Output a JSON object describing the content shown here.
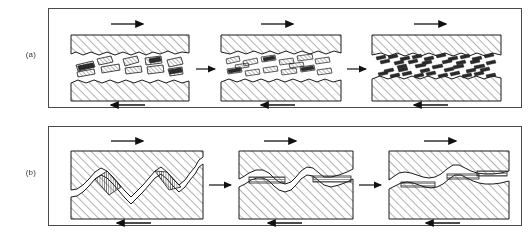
{
  "figure": {
    "panels": [
      {
        "id": "panel-a",
        "label": "(a)",
        "caption_text": "(a)",
        "mechanism": "wear-debris-fragmentation",
        "stages": [
          {
            "index": 1,
            "name": "stage-coarse-debris",
            "top_arrow": "right",
            "bottom_arrow": "left",
            "particle_count": 14,
            "particle_size": "coarse"
          },
          {
            "index": 2,
            "name": "stage-medium-debris",
            "top_arrow": "right",
            "bottom_arrow": "left",
            "particle_count": 16,
            "particle_size": "medium"
          },
          {
            "index": 3,
            "name": "stage-fine-debris",
            "top_arrow": "right",
            "bottom_arrow": "left",
            "particle_count": 46,
            "particle_size": "fine"
          }
        ],
        "transition_arrows": [
          "right",
          "right"
        ]
      },
      {
        "id": "panel-b",
        "label": "(b)",
        "caption_text": "(b)",
        "mechanism": "asperity-interlocking-flattening",
        "stages": [
          {
            "index": 1,
            "name": "stage-interlocked-asperities",
            "top_arrow": "right",
            "bottom_arrow": "left",
            "contact_patches": 2,
            "asperity_form": "steep-interlocked"
          },
          {
            "index": 2,
            "name": "stage-partial-flattening",
            "top_arrow": "right",
            "bottom_arrow": "left",
            "contact_patches": 2,
            "asperity_form": "rounded-void"
          },
          {
            "index": 3,
            "name": "stage-flattened-contact",
            "top_arrow": "right",
            "bottom_arrow": "left",
            "contact_patches": 3,
            "asperity_form": "flat-plateau"
          }
        ],
        "transition_arrows": [
          "right",
          "right"
        ]
      }
    ],
    "colors": {
      "frame": "#4a4a4a",
      "line": "#1a1a1a",
      "hatch": "#555555",
      "particle_fill": "#2b2b2b",
      "arrow": "#111111",
      "background": "#ffffff"
    },
    "arrows": {
      "top_direction_label": "right",
      "bottom_direction_label": "left"
    }
  }
}
